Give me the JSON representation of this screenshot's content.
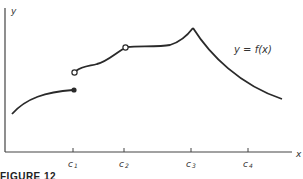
{
  "axes": {
    "y_label": "y",
    "x_label": "x"
  },
  "ticks": [
    {
      "id": "c1",
      "base": "c",
      "sub": "1"
    },
    {
      "id": "c2",
      "base": "c",
      "sub": "2"
    },
    {
      "id": "c3",
      "base": "c",
      "sub": "3"
    },
    {
      "id": "c4",
      "base": "c",
      "sub": "4"
    }
  ],
  "curve_label": "y = f(x)",
  "caption": "FIGURE 12",
  "colors": {
    "curve": "#2a2a2a",
    "axis": "#444444",
    "background": "#ffffff"
  },
  "points": {
    "filled_at_c1": "closed endpoint of left segment at x = c1",
    "open_at_c1": "open (hole) start of second segment at x = c1",
    "open_at_c2": "removable discontinuity (hole) at x = c2"
  }
}
